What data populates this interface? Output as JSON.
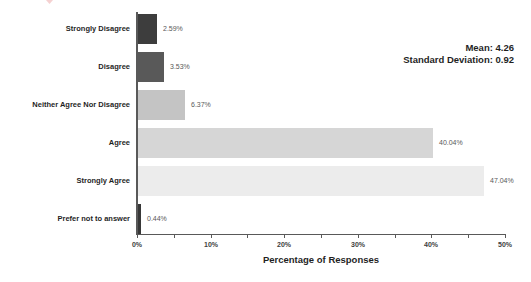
{
  "chart_data": {
    "type": "bar",
    "orientation": "horizontal",
    "title": "",
    "categories": [
      "Strongly Disagree",
      "Disagree",
      "Neither Agree Nor Disagree",
      "Agree",
      "Strongly Agree",
      "Prefer not to answer"
    ],
    "values": [
      2.59,
      3.53,
      6.37,
      40.04,
      47.04,
      0.44
    ],
    "value_labels": [
      "2.59%",
      "3.53%",
      "6.37%",
      "40.04%",
      "47.04%",
      "0.44%"
    ],
    "bar_colors": [
      "#3d3d3d",
      "#595959",
      "#c4c4c4",
      "#d6d6d6",
      "#ececec",
      "#383838"
    ],
    "xlabel": "Percentage of Responses",
    "ylabel": "",
    "xlim": [
      0,
      50
    ],
    "x_major_ticks": [
      0,
      10,
      20,
      30,
      40,
      50
    ],
    "x_major_tick_labels": [
      "0%",
      "10%",
      "20%",
      "30%",
      "40%",
      "50%"
    ],
    "x_minor_tick_step": 5,
    "grid": "off",
    "legend": "none",
    "annotations": [
      "Mean: 4.26",
      "Standard Deviation: 0.92"
    ]
  },
  "stats": {
    "mean_label": "Mean: 4.26",
    "std_label": "Standard Deviation: 0.92"
  },
  "colors": {
    "background": "#ffffff",
    "axis": "#595959",
    "category_text": "#1f1f1f",
    "value_text": "#595959"
  }
}
